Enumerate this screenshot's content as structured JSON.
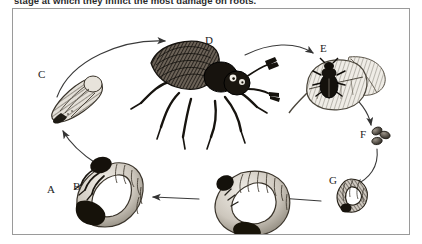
{
  "caption": {
    "text": "stage at which they inflict the most damage on roots."
  },
  "figure": {
    "border_color": "#9a9a9a",
    "background_color": "#ffffff",
    "ink_color": "#1d1d1d",
    "stages": [
      {
        "id": "A",
        "label": "A",
        "subject": "large-white-c-shaped-grub",
        "x": 34,
        "y": 175
      },
      {
        "id": "B",
        "label": "B",
        "subject": "mature-grub-with-legs",
        "x": 60,
        "y": 172
      },
      {
        "id": "C",
        "label": "C",
        "subject": "pupa",
        "x": 25,
        "y": 60
      },
      {
        "id": "D",
        "label": "D",
        "subject": "adult-beetle",
        "x": 192,
        "y": 26
      },
      {
        "id": "E",
        "label": "E",
        "subject": "beetle-feeding-on-leaf",
        "x": 307,
        "y": 34
      },
      {
        "id": "F",
        "label": "F",
        "subject": "eggs",
        "x": 347,
        "y": 120
      },
      {
        "id": "G",
        "label": "G",
        "subject": "young-larva",
        "x": 316,
        "y": 166
      }
    ],
    "arrows": [
      {
        "from": "C",
        "to": "D",
        "shape": "curve-up-right"
      },
      {
        "from": "D",
        "to": "E",
        "shape": "curve-right"
      },
      {
        "from": "E",
        "to": "F",
        "shape": "curve-down-right"
      },
      {
        "from": "F",
        "to": "G",
        "shape": "curve-down-left"
      },
      {
        "from": "G",
        "to": "A",
        "shape": "straight-left"
      },
      {
        "from": "A",
        "to": "B",
        "shape": "straight-left"
      },
      {
        "from": "B",
        "to": "C",
        "shape": "curve-up-left"
      }
    ]
  }
}
